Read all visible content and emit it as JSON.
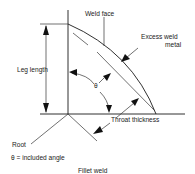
{
  "diagram": {
    "title": "Fillet weld",
    "labels": {
      "weld_face": "Weld face",
      "excess_weld_metal_line1": "Excess weld",
      "excess_weld_metal_line2": "metal",
      "leg_length": "Leg length",
      "theta": "θ",
      "throat_thickness": "Throat thickness",
      "root": "Root",
      "legend": "θ = included angle"
    },
    "colors": {
      "line": "#1a1a1a",
      "text": "#222222",
      "background": "#ffffff"
    }
  }
}
